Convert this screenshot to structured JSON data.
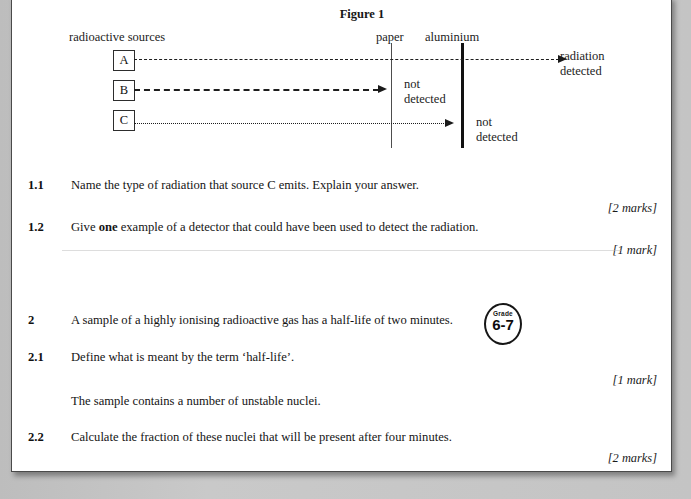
{
  "figure": {
    "title": "Figure 1",
    "sources_label": "radioactive sources",
    "barrier_labels": {
      "paper": "paper",
      "aluminium": "aluminium"
    },
    "sources": [
      {
        "id": "A",
        "line_style": "dashed",
        "outcome": "radiation detected"
      },
      {
        "id": "B",
        "line_style": "dashed",
        "outcome": "not detected"
      },
      {
        "id": "C",
        "line_style": "dotted",
        "outcome": "not detected"
      }
    ],
    "outcome_a_line1": "radiation",
    "outcome_a_line2": "detected",
    "outcome_b_line1": "not",
    "outcome_b_line2": "detected",
    "outcome_c_line1": "not",
    "outcome_c_line2": "detected"
  },
  "questions": [
    {
      "number": "1.1",
      "text": "Name the type of radiation that source C emits.  Explain your answer.",
      "marks": "[2 marks]"
    },
    {
      "number": "1.2",
      "text_before": "Give ",
      "text_bold": "one",
      "text_after": " example of a detector that could have been used to detect the radiation.",
      "marks": "[1 mark]"
    },
    {
      "number": "2",
      "text": "A sample of a highly ionising radioactive gas has a half-life of two minutes.",
      "badge_top": "Grade",
      "badge_main": "6-7"
    },
    {
      "number": "2.1",
      "text": "Define what is meant by the term ‘half-life’.",
      "marks": "[1 mark]"
    },
    {
      "number": "",
      "text": "The sample contains a number of unstable nuclei."
    },
    {
      "number": "2.2",
      "text": "Calculate the fraction of these nuclei that will be present after four minutes.",
      "marks": "[2 marks]"
    }
  ],
  "colors": {
    "page": "#ffffff",
    "background": "#c6c6c6",
    "ink": "#141414"
  }
}
